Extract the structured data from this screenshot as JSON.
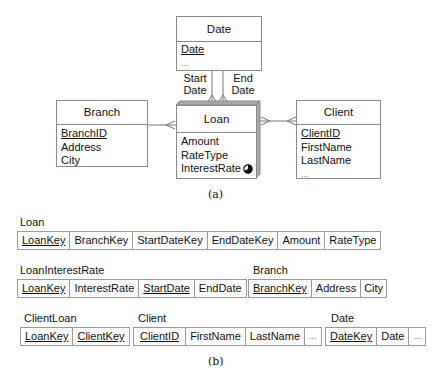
{
  "diagram_a": {
    "caption": "(a)",
    "entities": {
      "date": {
        "title": "Date",
        "attributes": [
          {
            "name": "Date",
            "key": true
          },
          {
            "name": "...",
            "key": false
          }
        ]
      },
      "branch": {
        "title": "Branch",
        "attributes": [
          {
            "name": "BranchID",
            "key": true
          },
          {
            "name": "Address",
            "key": false
          },
          {
            "name": "City",
            "key": false
          }
        ]
      },
      "loan": {
        "title": "Loan",
        "attributes": [
          {
            "name": "Amount",
            "key": false
          },
          {
            "name": "RateType",
            "key": false
          },
          {
            "name": "InterestRate",
            "key": false,
            "icon": "temporal-half-circle-icon"
          }
        ]
      },
      "client": {
        "title": "Client",
        "attributes": [
          {
            "name": "ClientID",
            "key": true
          },
          {
            "name": "FirstName",
            "key": false
          },
          {
            "name": "LastName",
            "key": false
          },
          {
            "name": "...",
            "key": false
          }
        ]
      }
    },
    "relationships": {
      "start_date": {
        "line1": "Start",
        "line2": "Date"
      },
      "end_date": {
        "line1": "End",
        "line2": "Date"
      }
    }
  },
  "diagram_b": {
    "caption": "(b)",
    "tables": {
      "loan": {
        "name": "Loan",
        "columns": [
          {
            "name": "LoanKey",
            "key": true
          },
          {
            "name": "BranchKey",
            "key": false
          },
          {
            "name": "StartDateKey",
            "key": false
          },
          {
            "name": "EndDateKey",
            "key": false
          },
          {
            "name": "Amount",
            "key": false
          },
          {
            "name": "RateType",
            "key": false
          }
        ]
      },
      "loan_interest_rate": {
        "name": "LoanInterestRate",
        "columns": [
          {
            "name": "LoanKey",
            "key": true
          },
          {
            "name": "InterestRate",
            "key": false
          },
          {
            "name": "StartDate",
            "key": true
          },
          {
            "name": "EndDate",
            "key": false
          }
        ]
      },
      "branch": {
        "name": "Branch",
        "columns": [
          {
            "name": "BranchKey",
            "key": true
          },
          {
            "name": "Address",
            "key": false
          },
          {
            "name": "City",
            "key": false
          }
        ]
      },
      "client_loan": {
        "name": "ClientLoan",
        "columns": [
          {
            "name": "LoanKey",
            "key": true
          },
          {
            "name": "ClientKey",
            "key": true
          }
        ]
      },
      "client": {
        "name": "Client",
        "columns": [
          {
            "name": "ClientID",
            "key": true
          },
          {
            "name": "FirstName",
            "key": false
          },
          {
            "name": "LastName",
            "key": false
          },
          {
            "name": "...",
            "key": false
          }
        ]
      },
      "date": {
        "name": "Date",
        "columns": [
          {
            "name": "DateKey",
            "key": true
          },
          {
            "name": "Date",
            "key": false
          },
          {
            "name": "...",
            "key": false
          }
        ]
      }
    }
  },
  "colors": {
    "border": "#8a8a8a",
    "loan_shade": "#a8a8a8",
    "line": "#777777"
  }
}
